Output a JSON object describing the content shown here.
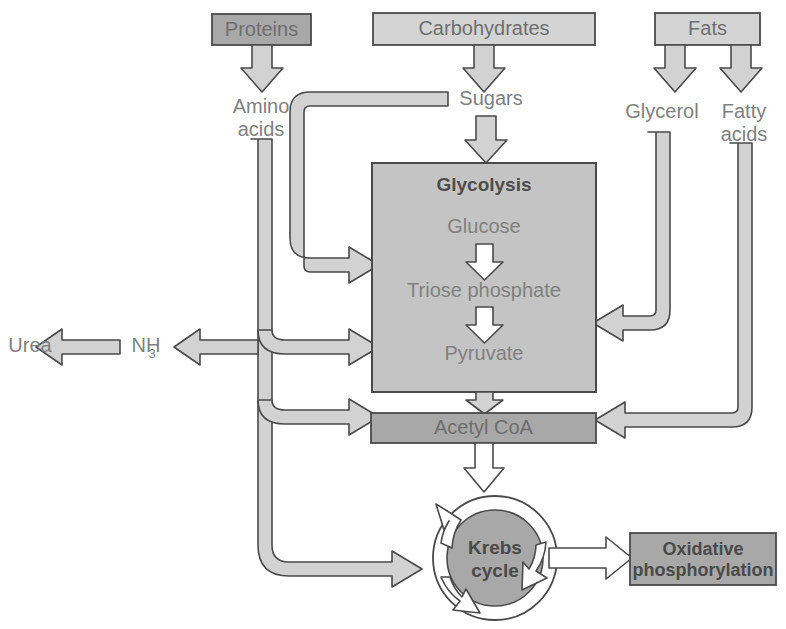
{
  "diagram": {
    "type": "flow-diagram",
    "colors": {
      "box_dark": "#a8a8a8",
      "box_mid": "#bdbdbd",
      "box_light": "#d4d4d4",
      "pipe_fill": "#d2d2d2",
      "arrow_fill": "#ffffff",
      "stroke": "#4a4a4a",
      "text_gray": "#808080",
      "background": "#ffffff"
    },
    "nutrient_boxes": [
      {
        "id": "proteins",
        "label": "Proteins",
        "shade": "dark"
      },
      {
        "id": "carbohydrates",
        "label": "Carbohydrates",
        "shade": "light"
      },
      {
        "id": "fats",
        "label": "Fats",
        "shade": "light"
      }
    ],
    "metabolite_labels": [
      {
        "id": "amino-acids",
        "line1": "Amino",
        "line2": "acids"
      },
      {
        "id": "sugars",
        "line1": "Sugars",
        "line2": ""
      },
      {
        "id": "glycerol",
        "line1": "Glycerol",
        "line2": ""
      },
      {
        "id": "fatty-acids",
        "line1": "Fatty",
        "line2": "acids"
      }
    ],
    "glycolysis": {
      "title": "Glycolysis",
      "steps": [
        "Glucose",
        "Triose phosphate",
        "Pyruvate"
      ]
    },
    "acetyl_coa": {
      "label": "Acetyl CoA"
    },
    "krebs": {
      "line1": "Krebs",
      "line2": "cycle"
    },
    "oxphos": {
      "line1": "Oxidative",
      "line2": "phosphorylation"
    },
    "nitrogen_waste": {
      "urea": "Urea",
      "ammonia": "NH",
      "ammonia_sub": "3"
    }
  }
}
